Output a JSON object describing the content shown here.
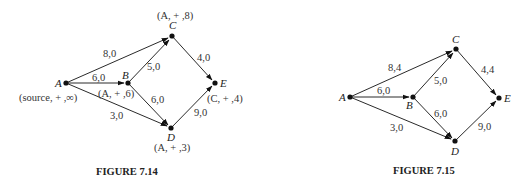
{
  "figures": [
    {
      "caption": "FIGURE 7.14",
      "nodes": [
        {
          "id": "A",
          "name": "A",
          "label": "(source, + ,∞)"
        },
        {
          "id": "B",
          "name": "B",
          "label": "(A, + ,6)"
        },
        {
          "id": "C",
          "name": "C",
          "label": "(A, + ,8)"
        },
        {
          "id": "D",
          "name": "D",
          "label": "(A, + ,3)"
        },
        {
          "id": "E",
          "name": "E",
          "label": "(C, + ,4)"
        }
      ],
      "edges": [
        {
          "from": "A",
          "to": "C",
          "label": "8,0"
        },
        {
          "from": "A",
          "to": "B",
          "label": "6,0"
        },
        {
          "from": "A",
          "to": "D",
          "label": "3,0"
        },
        {
          "from": "B",
          "to": "C",
          "label": "5,0"
        },
        {
          "from": "B",
          "to": "D",
          "label": "6,0"
        },
        {
          "from": "C",
          "to": "E",
          "label": "4,0"
        },
        {
          "from": "D",
          "to": "E",
          "label": "9,0"
        }
      ]
    },
    {
      "caption": "FIGURE 7.15",
      "nodes": [
        {
          "id": "A",
          "name": "A"
        },
        {
          "id": "B",
          "name": "B"
        },
        {
          "id": "C",
          "name": "C"
        },
        {
          "id": "D",
          "name": "D"
        },
        {
          "id": "E",
          "name": "E"
        }
      ],
      "edges": [
        {
          "from": "A",
          "to": "C",
          "label": "8,4"
        },
        {
          "from": "A",
          "to": "B",
          "label": "6,0"
        },
        {
          "from": "A",
          "to": "D",
          "label": "3,0"
        },
        {
          "from": "B",
          "to": "C",
          "label": "5,0"
        },
        {
          "from": "B",
          "to": "D",
          "label": "6,0"
        },
        {
          "from": "C",
          "to": "E",
          "label": "4,4"
        },
        {
          "from": "D",
          "to": "E",
          "label": "9,0"
        }
      ]
    }
  ]
}
